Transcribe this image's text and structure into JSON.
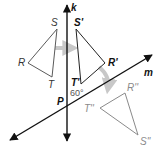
{
  "diagram": {
    "lines": {
      "k": {
        "label": "k"
      },
      "m": {
        "label": "m"
      }
    },
    "intersection": {
      "label": "P",
      "angle_label": "60°"
    },
    "triangles": {
      "original": {
        "vertices": {
          "R": "R",
          "S": "S",
          "T": "T"
        },
        "color": "#5a5a5a"
      },
      "first_image": {
        "vertices": {
          "R": "R'",
          "S": "S'",
          "T": "T'"
        },
        "color": "#222222"
      },
      "second_image": {
        "vertices": {
          "R": "R''",
          "S": "S''",
          "T": "T''"
        },
        "color": "#8a8a8a"
      }
    },
    "colors": {
      "line": "#111111",
      "arrow_gray": "#c8c8c8"
    }
  }
}
